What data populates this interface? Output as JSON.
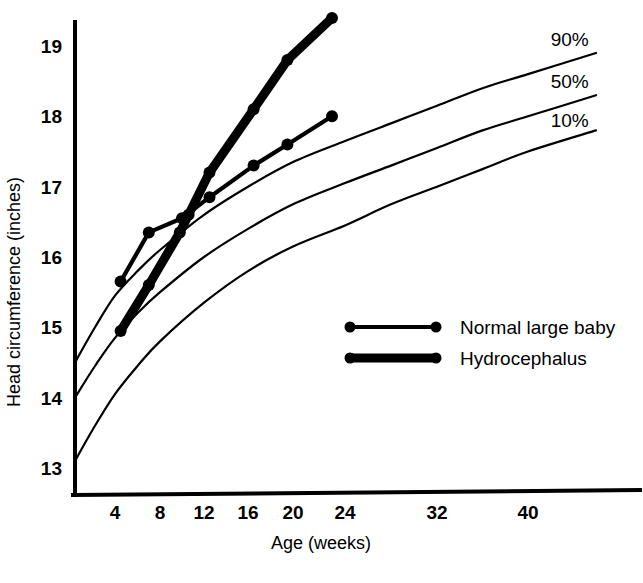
{
  "chart_data": {
    "type": "line",
    "title": "",
    "xlabel": "Age (weeks)",
    "ylabel": "Head circumference (inches)",
    "xticks": [
      4,
      8,
      12,
      16,
      20,
      24,
      32,
      40
    ],
    "xtick_labels": [
      "4",
      "8",
      "12",
      "16",
      "20",
      "24",
      "32",
      "40"
    ],
    "yticks": [
      13,
      14,
      15,
      16,
      17,
      18,
      19
    ],
    "ytick_labels": [
      "13",
      "14",
      "15",
      "16",
      "17",
      "18",
      "19"
    ],
    "ylim": [
      12.6,
      19.6
    ],
    "xlim": [
      0,
      46
    ],
    "grid": false,
    "legend_position": "center-right-inside",
    "annotations": [
      {
        "text": "90%",
        "x": 42,
        "y": 19.0
      },
      {
        "text": "50%",
        "x": 42,
        "y": 18.4
      },
      {
        "text": "10%",
        "x": 42,
        "y": 17.85
      }
    ],
    "series": [
      {
        "name": "Normal large baby",
        "style": "thin-marker-line",
        "points": [
          {
            "x": 4.5,
            "y": 15.65
          },
          {
            "x": 7.0,
            "y": 16.35
          },
          {
            "x": 10.0,
            "y": 16.55
          },
          {
            "x": 12.5,
            "y": 16.85
          },
          {
            "x": 16.5,
            "y": 17.3
          },
          {
            "x": 19.5,
            "y": 17.6
          },
          {
            "x": 23.0,
            "y": 18.0
          }
        ]
      },
      {
        "name": "Hydrocephalus",
        "style": "thick-marker-line",
        "points": [
          {
            "x": 4.5,
            "y": 14.95
          },
          {
            "x": 7.0,
            "y": 15.6
          },
          {
            "x": 9.8,
            "y": 16.35
          },
          {
            "x": 10.6,
            "y": 16.6
          },
          {
            "x": 12.5,
            "y": 17.2
          },
          {
            "x": 16.5,
            "y": 18.1
          },
          {
            "x": 19.5,
            "y": 18.8
          },
          {
            "x": 23.0,
            "y": 19.4
          }
        ]
      },
      {
        "name": "90th percentile",
        "style": "reference-curve",
        "points": [
          {
            "x": 0,
            "y": 14.5
          },
          {
            "x": 2,
            "y": 15.0
          },
          {
            "x": 4,
            "y": 15.45
          },
          {
            "x": 6,
            "y": 15.8
          },
          {
            "x": 8,
            "y": 16.1
          },
          {
            "x": 12,
            "y": 16.6
          },
          {
            "x": 16,
            "y": 17.0
          },
          {
            "x": 20,
            "y": 17.35
          },
          {
            "x": 24,
            "y": 17.65
          },
          {
            "x": 28,
            "y": 17.9
          },
          {
            "x": 32,
            "y": 18.15
          },
          {
            "x": 36,
            "y": 18.4
          },
          {
            "x": 40,
            "y": 18.6
          },
          {
            "x": 46,
            "y": 18.9
          }
        ]
      },
      {
        "name": "50th percentile",
        "style": "reference-curve",
        "points": [
          {
            "x": 0,
            "y": 14.0
          },
          {
            "x": 2,
            "y": 14.45
          },
          {
            "x": 4,
            "y": 14.85
          },
          {
            "x": 6,
            "y": 15.2
          },
          {
            "x": 8,
            "y": 15.5
          },
          {
            "x": 12,
            "y": 16.0
          },
          {
            "x": 16,
            "y": 16.4
          },
          {
            "x": 20,
            "y": 16.75
          },
          {
            "x": 24,
            "y": 17.05
          },
          {
            "x": 28,
            "y": 17.3
          },
          {
            "x": 32,
            "y": 17.55
          },
          {
            "x": 36,
            "y": 17.8
          },
          {
            "x": 40,
            "y": 18.0
          },
          {
            "x": 46,
            "y": 18.3
          }
        ]
      },
      {
        "name": "10th percentile",
        "style": "reference-curve",
        "points": [
          {
            "x": 0,
            "y": 13.1
          },
          {
            "x": 2,
            "y": 13.6
          },
          {
            "x": 4,
            "y": 14.05
          },
          {
            "x": 6,
            "y": 14.45
          },
          {
            "x": 8,
            "y": 14.8
          },
          {
            "x": 12,
            "y": 15.35
          },
          {
            "x": 16,
            "y": 15.8
          },
          {
            "x": 20,
            "y": 16.15
          },
          {
            "x": 24,
            "y": 16.45
          },
          {
            "x": 28,
            "y": 16.75
          },
          {
            "x": 32,
            "y": 17.0
          },
          {
            "x": 36,
            "y": 17.25
          },
          {
            "x": 40,
            "y": 17.5
          },
          {
            "x": 46,
            "y": 17.8
          }
        ]
      }
    ]
  },
  "legend": {
    "items": [
      {
        "label": "Normal large baby",
        "style": "thin"
      },
      {
        "label": "Hydrocephalus",
        "style": "thick"
      }
    ]
  },
  "colors": {
    "ink": "#000000",
    "background": "#ffffff"
  }
}
